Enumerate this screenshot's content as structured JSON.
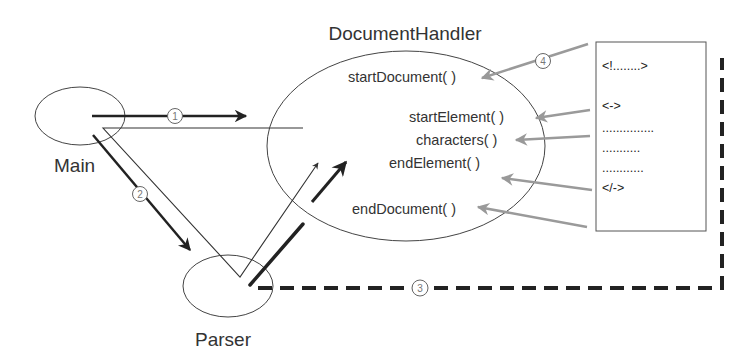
{
  "title": "DocumentHandler",
  "nodes": {
    "main": {
      "label": "Main"
    },
    "parser": {
      "label": "Parser"
    },
    "handler": {
      "label": "DocumentHandler",
      "methods": [
        "startDocument( )",
        "startElement( )",
        "characters( )",
        "endElement( )",
        "endDocument( )"
      ]
    },
    "document": {
      "lines": [
        "<!........>",
        "<->",
        "...............",
        "...........",
        "............",
        "</->"
      ]
    }
  },
  "steps": [
    {
      "number": "1",
      "from": "Main",
      "to": "DocumentHandler"
    },
    {
      "number": "2",
      "from": "Main",
      "to": "Parser"
    },
    {
      "number": "3",
      "from": "Parser",
      "to": "Document"
    },
    {
      "number": "4",
      "from": "Document",
      "to": "DocumentHandler"
    }
  ],
  "colors": {
    "stroke": "#333333",
    "event_arrow": "#999999",
    "step_circle": "#666666"
  }
}
